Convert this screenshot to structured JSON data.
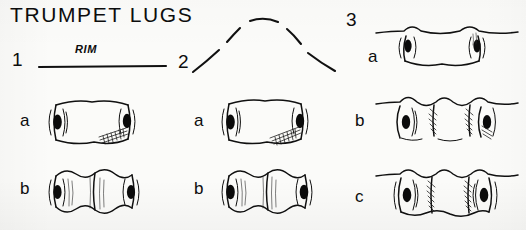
{
  "plate": {
    "title": "TRUMPET LUGS",
    "background_color": "#fbfbf9",
    "ink_color": "#101010",
    "medium": "hand-drawn ink line illustration"
  },
  "groups": [
    {
      "number": "1",
      "rim_label": "RIM",
      "rim_form": "straight",
      "variants": [
        {
          "letter": "a",
          "form": "single trumpet lug, hatching at lower right"
        },
        {
          "letter": "b",
          "form": "double trumpet lug, two lobes"
        }
      ]
    },
    {
      "number": "2",
      "rim_label": "",
      "rim_form": "arched",
      "variants": [
        {
          "letter": "a",
          "form": "single trumpet lug, hatching at lower right"
        },
        {
          "letter": "b",
          "form": "double trumpet lug, two lobes"
        }
      ]
    },
    {
      "number": "3",
      "rim_label": "",
      "rim_form": "wavy",
      "variants": [
        {
          "letter": "a",
          "form": "single trumpet lug on wavy rim"
        },
        {
          "letter": "b",
          "form": "trumpet lug with two hatched ribs"
        },
        {
          "letter": "c",
          "form": "trumpet lug with two hatched ribs and paired eyes"
        }
      ]
    }
  ]
}
